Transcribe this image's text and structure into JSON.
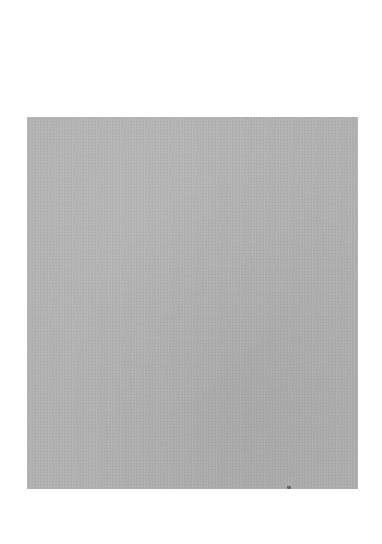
{
  "image": {
    "background_color": "#ffffff",
    "subject": "gray textured rectangle (fabric/paper sample)",
    "swatch": {
      "color": "#b4b4b4",
      "x": 27,
      "y": 117,
      "width": 331,
      "height": 372
    },
    "mark": {
      "description": "small dark speck at bottom edge",
      "x": 289,
      "y": 488
    }
  }
}
